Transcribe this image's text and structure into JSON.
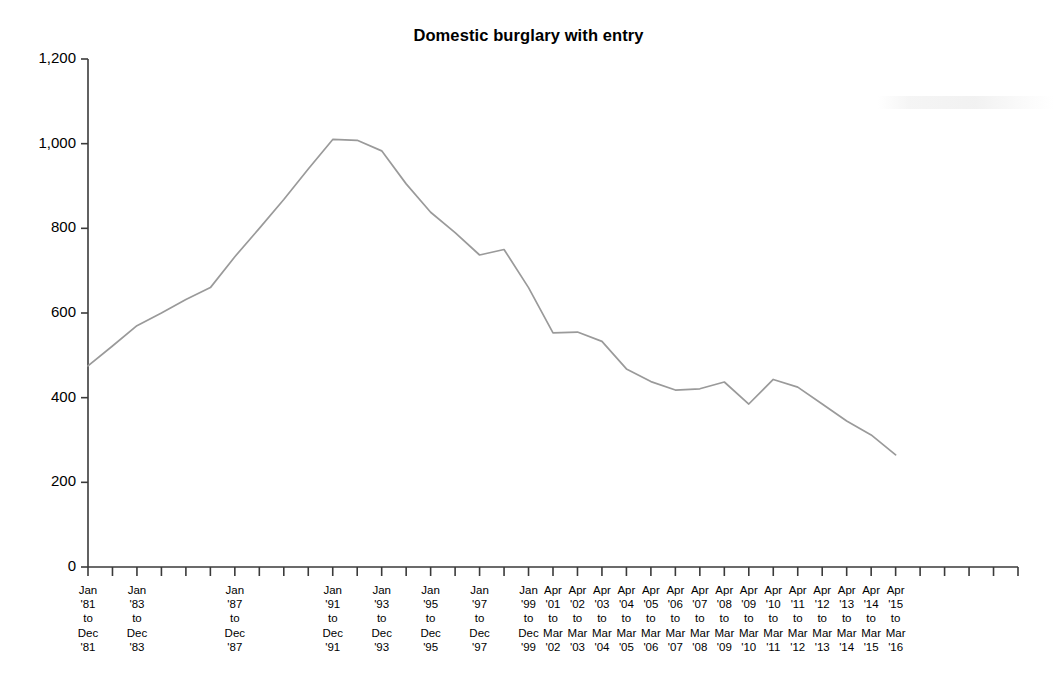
{
  "chart_data": {
    "type": "line",
    "title": "Domestic burglary with entry",
    "xlabel": "",
    "ylabel": "",
    "ylim": [
      0,
      1200
    ],
    "yticks": [
      0,
      200,
      400,
      600,
      800,
      1000,
      1200
    ],
    "ytick_labels": [
      "0",
      "200",
      "400",
      "600",
      "800",
      "1,000",
      "1,200"
    ],
    "grid": false,
    "legend": false,
    "line_color": "#9a9a9a",
    "categories": [
      "Jan '81 to Dec '81",
      "Jan '82 to Dec '82",
      "Jan '83 to Dec '83",
      "Jan '84 to Dec '84",
      "Jan '85 to Dec '85",
      "Jan '86 to Dec '86",
      "Jan '87 to Dec '87",
      "Jan '88 to Dec '88",
      "Jan '89 to Dec '89",
      "Jan '90 to Dec '90",
      "Jan '91 to Dec '91",
      "Jan '92 to Dec '92",
      "Jan '93 to Dec '93",
      "Jan '94 to Dec '94",
      "Jan '95 to Dec '95",
      "Jan '96 to Dec '96",
      "Jan '97 to Dec '97",
      "Jan '98 to Dec '98",
      "Jan '99 to Dec '99",
      "Apr '01 to Mar '02",
      "Apr '02 to Mar '03",
      "Apr '03 to Mar '04",
      "Apr '04 to Mar '05",
      "Apr '05 to Mar '06",
      "Apr '06 to Mar '07",
      "Apr '07 to Mar '08",
      "Apr '08 to Mar '09",
      "Apr '09 to Mar '10",
      "Apr '10 to Mar '11",
      "Apr '11 to Mar '12",
      "Apr '12 to Mar '13",
      "Apr '13 to Mar '14",
      "Apr '14 to Mar '15",
      "Apr '15 to Mar '16"
    ],
    "values": [
      475,
      522,
      570,
      600,
      632,
      660,
      733,
      800,
      868,
      940,
      1010,
      1008,
      983,
      905,
      838,
      790,
      737,
      750,
      660,
      553,
      555,
      533,
      468,
      438,
      418,
      421,
      437,
      385,
      443,
      425,
      385,
      345,
      312,
      265
    ],
    "xtick_labels": [
      {
        "index": 0,
        "line1": "Jan",
        "line2": "'81",
        "line3": "to",
        "line4": "Dec",
        "line5": "'81"
      },
      {
        "index": 2,
        "line1": "Jan",
        "line2": "'83",
        "line3": "to",
        "line4": "Dec",
        "line5": "'83"
      },
      {
        "index": 6,
        "line1": "Jan",
        "line2": "'87",
        "line3": "to",
        "line4": "Dec",
        "line5": "'87"
      },
      {
        "index": 10,
        "line1": "Jan",
        "line2": "'91",
        "line3": "to",
        "line4": "Dec",
        "line5": "'91"
      },
      {
        "index": 12,
        "line1": "Jan",
        "line2": "'93",
        "line3": "to",
        "line4": "Dec",
        "line5": "'93"
      },
      {
        "index": 14,
        "line1": "Jan",
        "line2": "'95",
        "line3": "to",
        "line4": "Dec",
        "line5": "'95"
      },
      {
        "index": 16,
        "line1": "Jan",
        "line2": "'97",
        "line3": "to",
        "line4": "Dec",
        "line5": "'97"
      },
      {
        "index": 18,
        "line1": "Jan",
        "line2": "'99",
        "line3": "to",
        "line4": "Dec",
        "line5": "'99"
      },
      {
        "index": 19,
        "line1": "Apr",
        "line2": "'01",
        "line3": "to",
        "line4": "Mar",
        "line5": "'02"
      },
      {
        "index": 20,
        "line1": "Apr",
        "line2": "'02",
        "line3": "to",
        "line4": "Mar",
        "line5": "'03"
      },
      {
        "index": 21,
        "line1": "Apr",
        "line2": "'03",
        "line3": "to",
        "line4": "Mar",
        "line5": "'04"
      },
      {
        "index": 22,
        "line1": "Apr",
        "line2": "'04",
        "line3": "to",
        "line4": "Mar",
        "line5": "'05"
      },
      {
        "index": 23,
        "line1": "Apr",
        "line2": "'05",
        "line3": "to",
        "line4": "Mar",
        "line5": "'06"
      },
      {
        "index": 24,
        "line1": "Apr",
        "line2": "'06",
        "line3": "to",
        "line4": "Mar",
        "line5": "'07"
      },
      {
        "index": 25,
        "line1": "Apr",
        "line2": "'07",
        "line3": "to",
        "line4": "Mar",
        "line5": "'08"
      },
      {
        "index": 26,
        "line1": "Apr",
        "line2": "'08",
        "line3": "to",
        "line4": "Mar",
        "line5": "'09"
      },
      {
        "index": 27,
        "line1": "Apr",
        "line2": "'09",
        "line3": "to",
        "line4": "Mar",
        "line5": "'10"
      },
      {
        "index": 28,
        "line1": "Apr",
        "line2": "'10",
        "line3": "to",
        "line4": "Mar",
        "line5": "'11"
      },
      {
        "index": 29,
        "line1": "Apr",
        "line2": "'11",
        "line3": "to",
        "line4": "Mar",
        "line5": "'12"
      },
      {
        "index": 30,
        "line1": "Apr",
        "line2": "'12",
        "line3": "to",
        "line4": "Mar",
        "line5": "'13"
      },
      {
        "index": 31,
        "line1": "Apr",
        "line2": "'13",
        "line3": "to",
        "line4": "Mar",
        "line5": "'14"
      },
      {
        "index": 32,
        "line1": "Apr",
        "line2": "'14",
        "line3": "to",
        "line4": "Mar",
        "line5": "'15"
      },
      {
        "index": 33,
        "line1": "Apr",
        "line2": "'15",
        "line3": "to",
        "line4": "Mar",
        "line5": "'16"
      }
    ],
    "total_ticks": 39
  }
}
